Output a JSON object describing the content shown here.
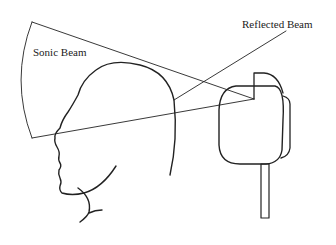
{
  "diagram": {
    "title": "",
    "labels": {
      "sonic_beam": "Sonic Beam",
      "reflected_beam": "Reflected Beam"
    },
    "elements": [
      "sonic-beam-cone",
      "reflected-beam-line",
      "head-profile",
      "transducer-device",
      "device-stand"
    ],
    "colors": {
      "stroke": "#222222",
      "background": "#ffffff"
    }
  }
}
